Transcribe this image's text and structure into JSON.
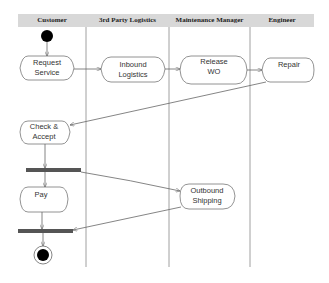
{
  "diagram": {
    "type": "UML activity diagram with swimlanes",
    "lanes": [
      {
        "label": "Customer"
      },
      {
        "label": "3rd Party Logistics"
      },
      {
        "label": "Maintenance Manager"
      },
      {
        "label": "Engineer"
      }
    ],
    "activities": [
      {
        "id": "request",
        "line1": "Request",
        "line2": "Service",
        "lane": "Customer"
      },
      {
        "id": "inbound",
        "line1": "Inbound",
        "line2": "Logistics",
        "lane": "3rd Party Logistics"
      },
      {
        "id": "release",
        "line1": "Release",
        "line2": "WO",
        "lane": "Maintenance Manager"
      },
      {
        "id": "repair",
        "line1": "Repair",
        "line2": "",
        "lane": "Engineer"
      },
      {
        "id": "check",
        "line1": "Check &",
        "line2": "Accept",
        "lane": "Customer"
      },
      {
        "id": "pay",
        "line1": "Pay",
        "line2": "",
        "lane": "Customer"
      },
      {
        "id": "outbound",
        "line1": "Outbound",
        "line2": "Shipping",
        "lane": "Maintenance Manager"
      }
    ],
    "transitions": [
      [
        "start",
        "request"
      ],
      [
        "request",
        "inbound"
      ],
      [
        "inbound",
        "release"
      ],
      [
        "release",
        "repair"
      ],
      [
        "repair",
        "check"
      ],
      [
        "check",
        "fork"
      ],
      [
        "fork",
        "pay"
      ],
      [
        "fork",
        "outbound"
      ],
      [
        "pay",
        "join"
      ],
      [
        "outbound",
        "join"
      ],
      [
        "join",
        "end"
      ]
    ],
    "colors": {
      "line": "#666666",
      "bar": "#555555",
      "header": "#d8d8d8"
    }
  }
}
